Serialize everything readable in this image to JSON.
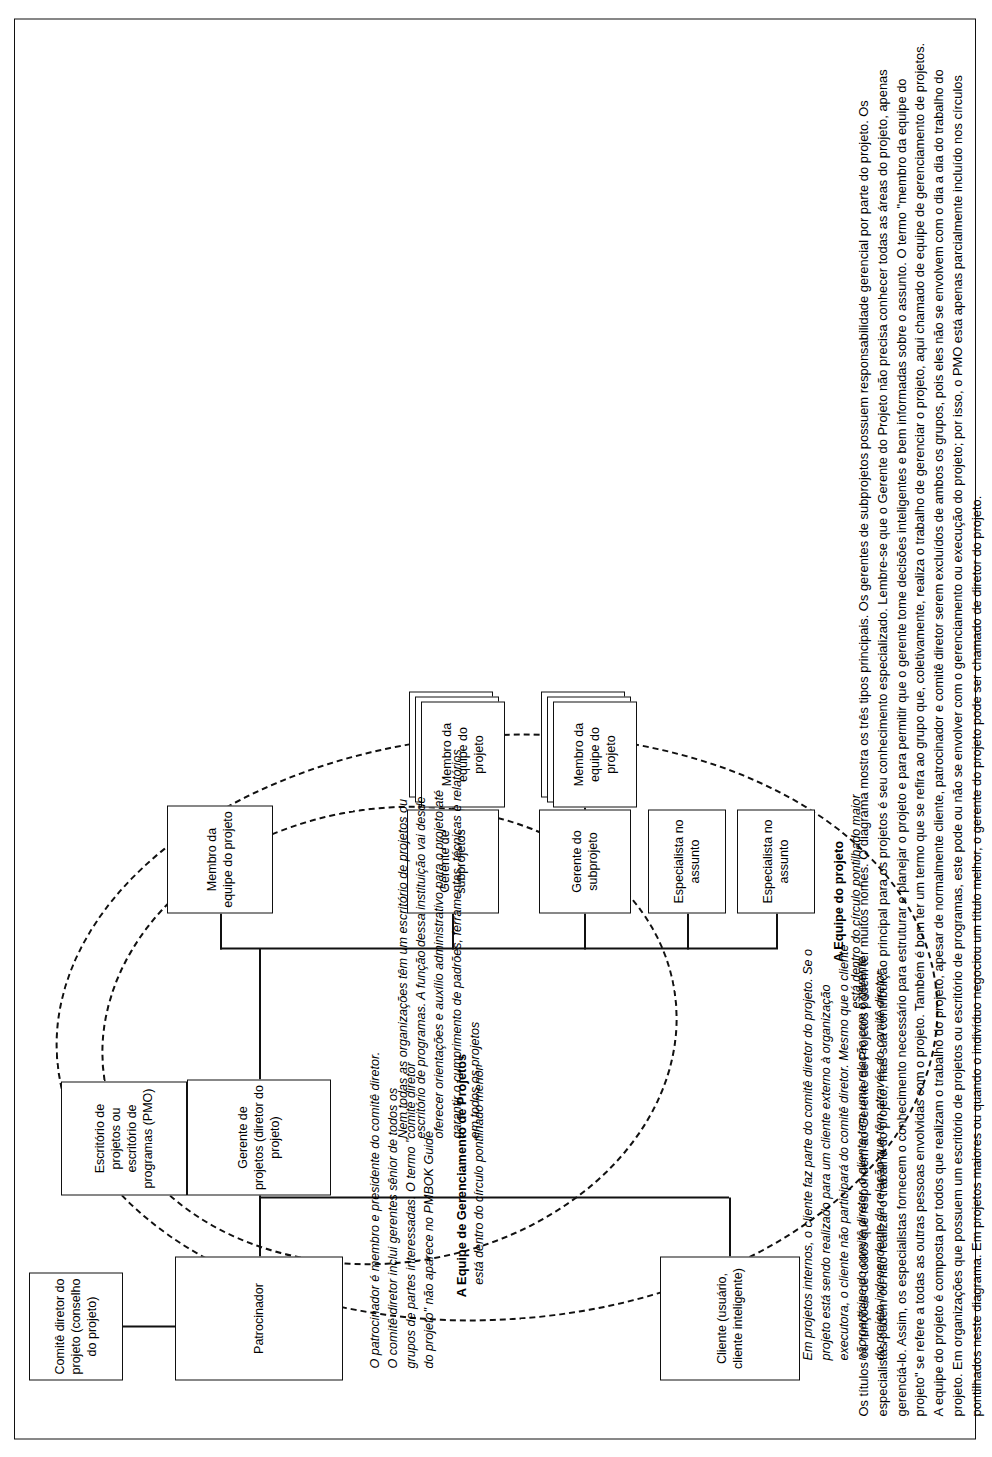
{
  "diagram": {
    "nodes": {
      "steering_committee": "Comitê diretor do projeto (conselho do projeto)",
      "sponsor": "Patrocinador",
      "client": "Cliente (usuário, cliente inteligente)",
      "pmo": "Escritório de projetos ou escritório de programas (PMO)",
      "project_manager": "Gerente de projetos (diretor do projeto)",
      "team_member_top": "Membro da equipe do projeto",
      "subprojects_manager": "Gerente de subprojetos",
      "subproject_manager": "Gerente do subprojeto",
      "team_member_stack_1": "Membro da equipe do projeto",
      "team_member_stack_2": "Membro da equipe do projeto",
      "specialist_1": "Especialista no assunto",
      "specialist_2": "Especialista no assunto"
    },
    "circle_labels": {
      "pm_team_title": "A Equipe de Gerenciamento de Projetos",
      "pm_team_sub": "está dentro do círculo pontilhado menor",
      "project_team_title": "A Equipe do projeto",
      "project_team_sub": "está dentro do círculo pontilhado maior"
    },
    "notes": {
      "sponsor_note": "O patrocinador é membro e presidente do comitê diretor. O comitê diretor inclui gerentes sênior de todos os grupos de partes interessadas. O termo \"comitê diretor do projeto\" não aparece no PMBOK Guide",
      "client_note": "Em projetos internos, o cliente faz parte do comitê diretor do projeto. Se o projeto está sendo realizado para um cliente externo à organização executora, o cliente não participará do comitê diretor. Mesmo que o cliente não participe do comitê diretor, o cliente tem uma relação com o gerente do projeto independente da relação que têm através do comitê diretor",
      "pmo_note": "Nem todas as organizações têm um escritório de projetos ou escritório de programas. A função dessa instituição vai desde oferecer orientações e auxílio administrativo para o projeto até garantir o cumprimento de padrões, ferramentas, técnicas e relatórios em todos os projetos"
    },
    "caption": "Os títulos ou funções de todos que respondem ao Gerente de Projetos podem ter muitos nomes. O diagrama mostra os três tipos principais. Os gerentes de subprojetos possuem responsabilidade gerencial por parte do projeto. Os especialistas podem ou não realizar o trabalho do projeto, mas sua contribuição principal para os projetos é seu conhecimento especializado. Lembre-se que o Gerente do Projeto não precisa conhecer todas as áreas do projeto, apenas gerenciá-lo. Assim, os especialistas fornecem o conhecimento necessário para estruturar e planejar o projeto e para permitir que o gerente tome decisões inteligentes e bem informadas sobre o assunto. O termo \"membro da equipe do projeto\" se refere a todas as outras pessoas envolvidas com o projeto. Também é bom ter um termo que se refira ao grupo que, coletivamente, realiza o trabalho de gerenciar o projeto, aqui chamado de equipe de gerenciamento de projetos. A equipe do projeto é composta por todos que realizam o trabalho do projeto, apesar de normalmente cliente, patrocinador e comitê diretor serem excluídos de ambos os grupos, pois eles não se envolvem com o dia a dia do trabalho do projeto. Em organizações que possuem um escritório de projetos ou escritório de programas, este pode ou não se envolver com o gerenciamento ou execução do projeto; por isso, o PMO está apenas parcialmente incluído nos círculos pontilhados neste diagrama. Em projetos maiores ou quando o indivíduo negociou um título melhor, o gerente do projeto pode ser chamado de diretor do projeto."
  }
}
